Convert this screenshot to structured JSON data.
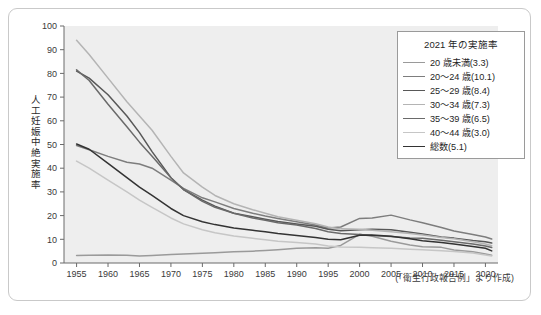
{
  "figure": {
    "source_note": "(「衛生行政報告例」より作成)",
    "y_axis_label": "人工妊娠中絶実施率"
  },
  "legend": {
    "title": "2021 年の実施率",
    "entries": [
      {
        "label": "20 歳未満(3.3)",
        "color": "#9a9a9a"
      },
      {
        "label": "20〜24 歳(10.1)",
        "color": "#7d7d7d"
      },
      {
        "label": "25〜29 歳(8.4)",
        "color": "#585858"
      },
      {
        "label": "30〜34 歳(7.3)",
        "color": "#b4b4b4"
      },
      {
        "label": "35〜39 歳(6.5)",
        "color": "#6a6a6a"
      },
      {
        "label": "40〜44 歳(3.0)",
        "color": "#c6c6c6"
      },
      {
        "label": "総数(5.1)",
        "color": "#333333"
      }
    ]
  },
  "chart_data": {
    "type": "line",
    "title": "",
    "xlabel": "",
    "ylabel": "人工妊娠中絶実施率",
    "xlim": [
      1953,
      2022
    ],
    "ylim": [
      0,
      100
    ],
    "yticks": [
      0,
      10,
      20,
      30,
      40,
      50,
      60,
      70,
      80,
      90,
      100
    ],
    "xticks": [
      1955,
      1960,
      1965,
      1970,
      1975,
      1980,
      1985,
      1990,
      1995,
      2000,
      2005,
      2010,
      2015,
      2020
    ],
    "grid": false,
    "legend_position": "top-right",
    "x": [
      1955,
      1957,
      1960,
      1963,
      1965,
      1967,
      1970,
      1972,
      1975,
      1977,
      1980,
      1983,
      1985,
      1987,
      1990,
      1993,
      1995,
      1997,
      2000,
      2002,
      2005,
      2008,
      2010,
      2013,
      2015,
      2018,
      2020,
      2021
    ],
    "series": [
      {
        "name": "20 歳未満",
        "color": "#9a9a9a",
        "values": [
          3.2,
          3.3,
          3.4,
          3.3,
          3.0,
          3.2,
          3.6,
          3.8,
          4.1,
          4.3,
          4.7,
          5.0,
          5.3,
          5.6,
          6.2,
          6.4,
          6.2,
          7.4,
          12.1,
          11.3,
          9.2,
          7.6,
          6.9,
          6.6,
          5.5,
          4.7,
          3.8,
          3.3
        ]
      },
      {
        "name": "20〜24 歳",
        "color": "#7d7d7d",
        "values": [
          49.6,
          47.8,
          45.0,
          42.5,
          41.8,
          40.0,
          35.0,
          31.5,
          27.5,
          25.8,
          23.0,
          21.0,
          19.8,
          18.8,
          17.4,
          16.0,
          14.8,
          15.2,
          18.8,
          19.0,
          20.2,
          18.2,
          17.0,
          15.0,
          13.5,
          12.0,
          11.0,
          10.1
        ]
      },
      {
        "name": "25〜29 歳",
        "color": "#585858",
        "values": [
          81.0,
          78.0,
          71.0,
          62.0,
          55.0,
          47.0,
          36.0,
          31.0,
          26.5,
          24.0,
          21.0,
          19.5,
          18.5,
          17.5,
          16.5,
          15.5,
          14.2,
          13.6,
          14.0,
          14.2,
          14.0,
          13.0,
          12.2,
          11.0,
          10.5,
          9.5,
          9.0,
          8.4
        ]
      },
      {
        "name": "30〜34 歳",
        "color": "#b4b4b4",
        "values": [
          94.0,
          88.0,
          78.0,
          68.0,
          62.0,
          56.0,
          45.0,
          38.0,
          32.0,
          28.5,
          25.0,
          22.5,
          21.0,
          19.5,
          18.0,
          16.6,
          15.2,
          14.4,
          14.2,
          13.8,
          13.2,
          12.4,
          11.8,
          10.8,
          10.2,
          9.0,
          8.0,
          7.3
        ]
      },
      {
        "name": "35〜39 歳",
        "color": "#6a6a6a",
        "values": [
          81.5,
          77.0,
          67.0,
          57.5,
          51.0,
          45.0,
          36.0,
          31.0,
          26.0,
          23.5,
          21.0,
          19.0,
          18.0,
          17.0,
          16.0,
          14.6,
          13.2,
          12.4,
          12.0,
          11.6,
          11.2,
          10.6,
          10.4,
          9.6,
          9.0,
          8.0,
          7.2,
          6.5
        ]
      },
      {
        "name": "40〜44 歳",
        "color": "#c6c6c6",
        "values": [
          43.0,
          40.0,
          35.0,
          30.0,
          26.5,
          23.5,
          19.0,
          16.5,
          14.0,
          12.8,
          11.4,
          10.4,
          9.8,
          9.2,
          8.6,
          8.0,
          7.2,
          6.8,
          6.6,
          6.4,
          6.2,
          5.8,
          5.6,
          5.2,
          4.8,
          4.2,
          3.4,
          3.0
        ]
      },
      {
        "name": "総数",
        "color": "#333333",
        "values": [
          50.2,
          48.0,
          42.0,
          36.0,
          32.0,
          28.5,
          23.0,
          20.0,
          17.4,
          16.2,
          14.8,
          13.8,
          13.2,
          12.4,
          11.6,
          10.8,
          10.0,
          9.8,
          11.7,
          11.8,
          11.3,
          10.2,
          9.4,
          8.6,
          8.0,
          7.0,
          6.2,
          5.1
        ]
      }
    ]
  }
}
